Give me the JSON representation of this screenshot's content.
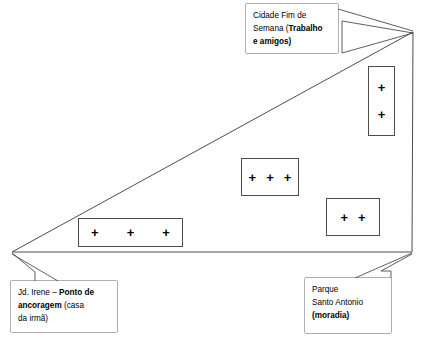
{
  "diagram": {
    "type": "hand-drawn territory map (mapa de rede / território)",
    "shape": {
      "name": "triangle-territory-outline",
      "vertices": [
        {
          "label": "left-anchor-vertex",
          "x": 12,
          "y": 252
        },
        {
          "label": "top-right-apex",
          "x": 413,
          "y": 32
        },
        {
          "label": "bottom-right-vertex",
          "x": 412,
          "y": 252
        }
      ],
      "stroke": "#4d4d4d"
    },
    "callouts": [
      {
        "id": "cidade",
        "name": "callout-cidade-fim-de-semana",
        "lines": [
          {
            "regular": "Cidade Fim de",
            "bold": ""
          },
          {
            "regular": "Semana (",
            "bold": "Trabalho"
          },
          {
            "regular": "",
            "bold": "e amigos)"
          }
        ],
        "plain_text": "Cidade Fim de Semana (Trabalho e amigos)",
        "points_to": "top-right-apex"
      },
      {
        "id": "jdirene",
        "name": "callout-jd-irene",
        "lines": [
          {
            "regular": "Jd. Irene – ",
            "bold": "Ponto de"
          },
          {
            "regular": " (casa",
            "bold": "ancoragem"
          },
          {
            "regular": "da irmã)",
            "bold": ""
          }
        ],
        "plain_text": "Jd. Irene – Ponto de ancoragem (casa da irmã)",
        "points_to": "left-anchor-vertex"
      },
      {
        "id": "parque",
        "name": "callout-parque-santo-antonio",
        "lines": [
          {
            "regular": "Parque",
            "bold": ""
          },
          {
            "regular": "Santo Antonio",
            "bold": ""
          },
          {
            "regular": "",
            "bold": "(moradia)"
          }
        ],
        "plain_text": "Parque Santo Antonio (moradia)",
        "points_to": "bottom-right-vertex"
      }
    ],
    "plus_boxes": [
      {
        "id": "right-tall",
        "name": "plus-box-right-tall",
        "count": 2,
        "orientation": "vertical",
        "symbol": "+"
      },
      {
        "id": "center",
        "name": "plus-box-center",
        "count": 3,
        "orientation": "horizontal",
        "symbol": "+"
      },
      {
        "id": "lower-right",
        "name": "plus-box-lower-right",
        "count": 2,
        "orientation": "horizontal",
        "symbol": "+"
      },
      {
        "id": "lower-left",
        "name": "plus-box-lower-left",
        "count": 3,
        "orientation": "horizontal",
        "symbol": "+"
      }
    ],
    "colors": {
      "background": "#ffffff",
      "stroke": "#4d4d4d",
      "text": "#000000"
    }
  }
}
